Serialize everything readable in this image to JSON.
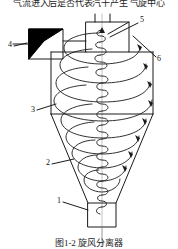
{
  "figure": {
    "top_text": "气流进入后是否代表汽干产生 气旋中心",
    "caption": "图1-2  旋风分离器",
    "alt": "cyclone-separator-schematic"
  },
  "callouts": [
    {
      "id": "1",
      "label": "1",
      "x": 57,
      "y": 199,
      "name": "callout-1-dust-outlet"
    },
    {
      "id": "2",
      "label": "2",
      "x": 46,
      "y": 161,
      "name": "callout-2-cone"
    },
    {
      "id": "3",
      "label": "3",
      "x": 31,
      "y": 108,
      "name": "callout-3-cylinder-body"
    },
    {
      "id": "4",
      "label": "4",
      "x": 8,
      "y": 43,
      "name": "callout-4-inlet"
    },
    {
      "id": "5",
      "label": "5",
      "x": 140,
      "y": 18,
      "name": "callout-5-gas-outlet-tube"
    },
    {
      "id": "6",
      "label": "6",
      "x": 157,
      "y": 57,
      "name": "callout-6-outer-vortex"
    }
  ],
  "colors": {
    "line": "#1a1a1a",
    "fill_solid": "#000000",
    "background": "#ffffff"
  },
  "geometry": {
    "outlet_tube_label": "gas-outlet-tube",
    "inlet_box_label": "tangential-inlet",
    "cylinder_label": "cylinder-body",
    "cone_label": "conical-section",
    "dust_box_label": "dust-discharge-box",
    "outer_spiral_label": "outer-descending-vortex",
    "inner_spiral_label": "inner-ascending-vortex"
  }
}
